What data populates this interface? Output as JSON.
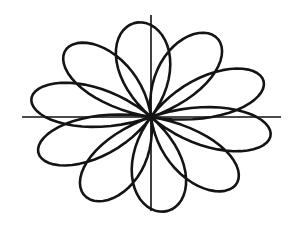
{
  "figure": {
    "background_color": "#ffffff",
    "width": 289,
    "height": 227
  },
  "axes": {
    "stroke_color": "#111111",
    "stroke_width": 1.6,
    "origin": {
      "x": 151,
      "y": 117
    },
    "x_axis": {
      "label": "horizontal-axis",
      "x1": 22,
      "y1": 117,
      "x2": 281,
      "y2": 117
    },
    "y_axis": {
      "label": "vertical-axis",
      "x1": 151,
      "y1": 15,
      "x2": 151,
      "y2": 211
    }
  },
  "chart_data": {
    "type": "line",
    "title": "",
    "subtitle": "",
    "xlabel": "",
    "ylabel": "",
    "coordinate_system": "polar",
    "equation": "r = cos(5*theta/2)",
    "grid": false,
    "legend": null,
    "annotations": [],
    "curve": {
      "name": "rose",
      "stroke_color": "#141414",
      "stroke_width": 2.6,
      "closed": true,
      "petal_count": 5,
      "max_radius_px": 122,
      "theta_range_deg": [
        0,
        720
      ],
      "theta_step_deg": 2,
      "center_px": {
        "x": 151,
        "y": 117
      },
      "radius_scale_px": 122,
      "x_squash": 1.0,
      "y_squash": 0.78,
      "rotation_deg": -12,
      "petals_deg": [
        60,
        132,
        204,
        276,
        348
      ],
      "tips_px": [
        {
          "angle_deg": 60,
          "x": 232,
          "y": 36
        },
        {
          "angle_deg": 132,
          "x": 40,
          "y": 72
        },
        {
          "angle_deg": 204,
          "x": 48,
          "y": 160
        },
        {
          "angle_deg": 276,
          "x": 106,
          "y": 205
        },
        {
          "angle_deg": 348,
          "x": 268,
          "y": 140
        }
      ],
      "extents_px": {
        "left": 32,
        "right": 272,
        "top": 19,
        "bottom": 212
      }
    }
  }
}
